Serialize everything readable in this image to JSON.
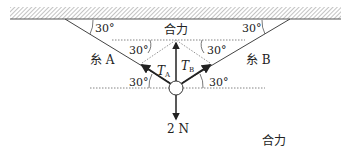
{
  "diagram": {
    "type": "force-equilibrium",
    "ceiling": {
      "label": "ceiling"
    },
    "strings": [
      {
        "id": "A",
        "label": "糸 A",
        "angle_with_ceiling": "30°"
      },
      {
        "id": "B",
        "label": "糸 B",
        "angle_with_ceiling": "30°"
      }
    ],
    "angle_labels": {
      "ceiling_left": "30°",
      "ceiling_right": "30°",
      "upper_left": "30°",
      "upper_right": "30°",
      "lower_left": "30°",
      "lower_right": "30°"
    },
    "forces": {
      "tension_a": {
        "symbol": "T",
        "subscript": "A"
      },
      "tension_b": {
        "symbol": "T",
        "subscript": "B"
      },
      "resultant": {
        "label": "合力"
      },
      "weight": {
        "label": "2 N"
      }
    },
    "extra_label": "合力"
  },
  "colors": {
    "line": "#333333",
    "hatch": "#888888",
    "dotted": "#666666"
  }
}
